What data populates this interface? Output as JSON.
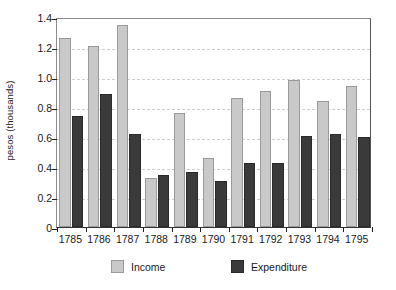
{
  "chart_data": {
    "type": "bar",
    "title": "",
    "xlabel": "",
    "ylabel": "pesos (thousands)",
    "categories": [
      "1785",
      "1786",
      "1787",
      "1788",
      "1789",
      "1790",
      "1791",
      "1792",
      "1793",
      "1794",
      "1795"
    ],
    "series": [
      {
        "name": "Income",
        "color": "#c9c9c9",
        "values": [
          1.26,
          1.21,
          1.35,
          0.33,
          0.76,
          0.46,
          0.86,
          0.91,
          0.98,
          0.84,
          0.94
        ]
      },
      {
        "name": "Expenditure",
        "color": "#3a3a3a",
        "values": [
          0.74,
          0.89,
          0.62,
          0.35,
          0.37,
          0.31,
          0.43,
          0.43,
          0.61,
          0.62,
          0.6
        ]
      }
    ],
    "ylim": [
      0,
      1.4
    ],
    "yticks": [
      "0",
      "0.2",
      "0.4",
      "0.6",
      "0.8",
      "1.0",
      "1.2",
      "1.4"
    ],
    "ytick_values": [
      0,
      0.2,
      0.4,
      0.6,
      0.8,
      1.0,
      1.2,
      1.4
    ],
    "grid": true,
    "legend_position": "bottom"
  }
}
